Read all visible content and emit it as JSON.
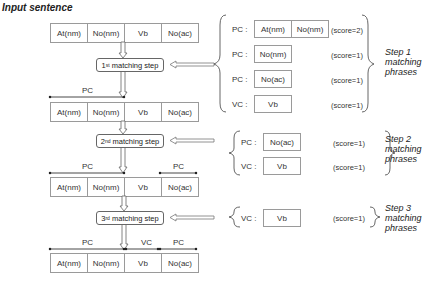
{
  "title": "Input sentence",
  "sentence_tokens": [
    "At(nm)",
    "No(nm)",
    "Vb",
    "No(ac)"
  ],
  "matching_steps": [
    {
      "num": "1",
      "sup": "st",
      "label": "matching step"
    },
    {
      "num": "2",
      "sup": "nd",
      "label": "matching step"
    },
    {
      "num": "3",
      "sup": "rd",
      "label": "matching step"
    }
  ],
  "span_labels": {
    "row2": [
      "PC"
    ],
    "row3": [
      "PC",
      "PC"
    ],
    "row4": [
      "PC",
      "VC",
      "PC"
    ]
  },
  "step_groups": [
    {
      "name": "Step 1 matching phrases",
      "name_lines": [
        "Step 1",
        "matching",
        "phrases"
      ],
      "phrases": [
        {
          "type": "PC :",
          "tokens": [
            "At(nm)",
            "No(nm)"
          ],
          "score": "(score=2)"
        },
        {
          "type": "PC :",
          "tokens": [
            "No(nm)"
          ],
          "score": "(score=1)"
        },
        {
          "type": "PC :",
          "tokens": [
            "No(ac)"
          ],
          "score": "(score=1)"
        },
        {
          "type": "VC :",
          "tokens": [
            "Vb"
          ],
          "score": "(score=1)"
        }
      ]
    },
    {
      "name": "Step 2 matching phrases",
      "name_lines": [
        "Step 2",
        "matching",
        "phrases"
      ],
      "phrases": [
        {
          "type": "PC :",
          "tokens": [
            "No(ac)"
          ],
          "score": "(score=1)"
        },
        {
          "type": "VC :",
          "tokens": [
            "Vb"
          ],
          "score": "(score=1)"
        }
      ]
    },
    {
      "name": "Step 3 matching phrases",
      "name_lines": [
        "Step 3",
        "matching",
        "phrases"
      ],
      "phrases": [
        {
          "type": "VC :",
          "tokens": [
            "Vb"
          ],
          "score": "(score=1)"
        }
      ]
    }
  ]
}
